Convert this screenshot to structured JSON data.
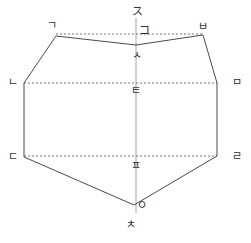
{
  "figure": {
    "stroke_color": "#4a4a4a",
    "dashed_color": "#6b6b6b",
    "axis_color": "#9a9a9a",
    "background_color": "#ffffff",
    "labels": [
      {
        "id": "top-axis",
        "text": "ス",
        "x": 132,
        "y": 6,
        "name": "label-jieut-top-axis"
      },
      {
        "id": "top-center-upper",
        "text": "コ",
        "x": 139,
        "y": 25,
        "name": "label-kieuk-top-center"
      },
      {
        "id": "top-left",
        "text": "ㄱ",
        "x": 47,
        "y": 20,
        "name": "label-giyeok-top-left"
      },
      {
        "id": "top-right",
        "text": "ㅂ",
        "x": 198,
        "y": 21,
        "name": "label-bieup-top-right"
      },
      {
        "id": "notch-center",
        "text": "ㅅ",
        "x": 132,
        "y": 50,
        "name": "label-siot-notch-center"
      },
      {
        "id": "mid-left",
        "text": "ㄴ",
        "x": 8,
        "y": 77,
        "name": "label-nieun-mid-left"
      },
      {
        "id": "mid-right",
        "text": "ㅁ",
        "x": 232,
        "y": 77,
        "name": "label-mieum-mid-right"
      },
      {
        "id": "mid-center",
        "text": "ㅌ",
        "x": 131,
        "y": 85,
        "name": "label-tieut-mid-center"
      },
      {
        "id": "low-left",
        "text": "ㄷ",
        "x": 8,
        "y": 151,
        "name": "label-digeut-low-left"
      },
      {
        "id": "low-right",
        "text": "ㄹ",
        "x": 232,
        "y": 151,
        "name": "label-rieul-low-right"
      },
      {
        "id": "low-center",
        "text": "ㅍ",
        "x": 131,
        "y": 160,
        "name": "label-pieup-low-center"
      },
      {
        "id": "bottom-apex",
        "text": "ㅇ",
        "x": 137,
        "y": 200,
        "name": "label-ieung-bottom-apex"
      },
      {
        "id": "bottom-axis",
        "text": "ㅊ",
        "x": 126,
        "y": 219,
        "name": "label-chieut-bottom-axis"
      }
    ],
    "geometry": {
      "polygon_points": "56,36 136,45 203,35 217,83 217,156 134,205 24,157 24,83",
      "dashed_lines": [
        {
          "name": "dashed-line-top",
          "x1": 56,
          "y1": 34,
          "x2": 203,
          "y2": 34
        },
        {
          "name": "dashed-line-middle",
          "x1": 24,
          "y1": 83,
          "x2": 217,
          "y2": 83
        },
        {
          "name": "dashed-line-bottom",
          "x1": 24,
          "y1": 156,
          "x2": 217,
          "y2": 156
        }
      ],
      "axis_line": {
        "name": "vertical-axis",
        "x1": 136,
        "y1": 18,
        "x2": 136,
        "y2": 213
      }
    }
  }
}
